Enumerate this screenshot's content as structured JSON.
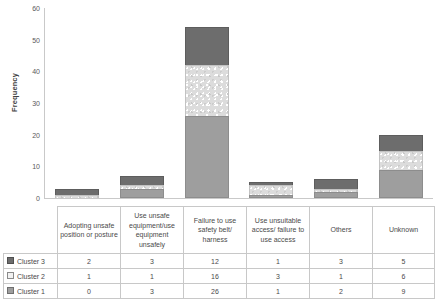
{
  "chart_data": {
    "type": "bar",
    "subtype": "stacked-column",
    "title": "",
    "xlabel": "",
    "ylabel": "Frequency",
    "ylim": [
      0,
      60
    ],
    "yticks": [
      0,
      10,
      20,
      30,
      40,
      50,
      60
    ],
    "grid": false,
    "legend_position": "table-left",
    "categories": [
      "Adopting unsafe position or posture",
      "Use unsafe equipment/use equipment unsafely",
      "Failure to use safety belt/ harness",
      "Use unsuitable access/ failure to use access",
      "Others",
      "Unknown"
    ],
    "series": [
      {
        "name": "Cluster 3",
        "values": [
          2,
          3,
          12,
          1,
          3,
          5
        ],
        "color": "#6d6d6d",
        "stack_order": "top"
      },
      {
        "name": "Cluster 2",
        "values": [
          1,
          1,
          16,
          3,
          1,
          6
        ],
        "color": "#dcdcdc",
        "stack_order": "middle"
      },
      {
        "name": "Cluster 1",
        "values": [
          0,
          3,
          26,
          1,
          2,
          9
        ],
        "color": "#9e9e9e",
        "stack_order": "bottom"
      }
    ],
    "stack_totals": [
      3,
      7,
      54,
      5,
      6,
      20
    ]
  },
  "axis": {
    "y_title": "Frequency",
    "y_tick_labels": [
      "60",
      "50",
      "40",
      "30",
      "20",
      "10",
      "0"
    ]
  },
  "table": {
    "rows": [
      {
        "label": "Cluster 3",
        "swatch": "dark-swatch-icon",
        "values": [
          "2",
          "3",
          "12",
          "1",
          "3",
          "5"
        ]
      },
      {
        "label": "Cluster 2",
        "swatch": "light-swatch-icon",
        "values": [
          "1",
          "1",
          "16",
          "3",
          "1",
          "6"
        ]
      },
      {
        "label": "Cluster 1",
        "swatch": "mid-swatch-icon",
        "values": [
          "0",
          "3",
          "26",
          "1",
          "2",
          "9"
        ]
      }
    ]
  },
  "caption": {
    "text": ""
  }
}
